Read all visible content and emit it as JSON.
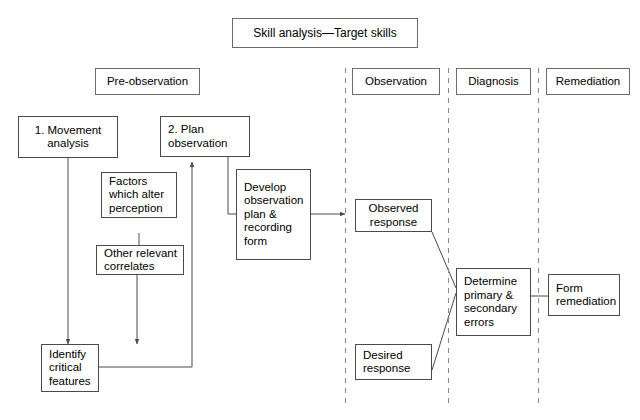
{
  "diagram": {
    "title_box": {
      "label": "Skill analysis—Target skills"
    },
    "phase_headers": [
      {
        "name": "pre-observation",
        "label": "Pre-observation"
      },
      {
        "name": "observation",
        "label": "Observation"
      },
      {
        "name": "diagnosis",
        "label": "Diagnosis"
      },
      {
        "name": "remediation",
        "label": "Remediation"
      }
    ],
    "nodes": [
      {
        "name": "movement-analysis",
        "label": "1. Movement\nanalysis"
      },
      {
        "name": "plan-observation",
        "label": "2. Plan\nobservation"
      },
      {
        "name": "factors-alter-perception",
        "label": "Factors\nwhich alter\nperception"
      },
      {
        "name": "other-relevant-correlates",
        "label": "Other relevant\ncorrelates"
      },
      {
        "name": "develop-observation-plan",
        "label": "Develop\nobservation\nplan &\nrecording\nform"
      },
      {
        "name": "identify-critical-features",
        "label": "Identify\ncritical\nfeatures"
      },
      {
        "name": "observed-response",
        "label": "Observed\nresponse"
      },
      {
        "name": "desired-response",
        "label": "Desired\nresponse"
      },
      {
        "name": "determine-errors",
        "label": "Determine\nprimary &\nsecondary\nerrors"
      },
      {
        "name": "form-remediation",
        "label": "Form\nremediation"
      }
    ],
    "colors": {
      "line": "#4a4a4a",
      "divider": "#8a8a8a",
      "background": "#ffffff",
      "text": "#000000"
    }
  }
}
